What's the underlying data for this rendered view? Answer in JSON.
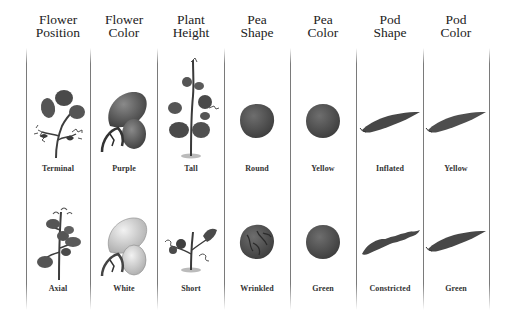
{
  "figure": {
    "columns": [
      {
        "id": "flower-position",
        "header": [
          "Flower",
          "Position"
        ],
        "dominant": "Terminal",
        "recessive": "Axial"
      },
      {
        "id": "flower-color",
        "header": [
          "Flower",
          "Color"
        ],
        "dominant": "Purple",
        "recessive": "White"
      },
      {
        "id": "plant-height",
        "header": [
          "Plant",
          "Height"
        ],
        "dominant": "Tall",
        "recessive": "Short"
      },
      {
        "id": "pea-shape",
        "header": [
          "Pea",
          "Shape"
        ],
        "dominant": "Round",
        "recessive": "Wrinkled"
      },
      {
        "id": "pea-color",
        "header": [
          "Pea",
          "Color"
        ],
        "dominant": "Yellow",
        "recessive": "Green"
      },
      {
        "id": "pod-shape",
        "header": [
          "Pod",
          "Shape"
        ],
        "dominant": "Inflated",
        "recessive": "Constricted"
      },
      {
        "id": "pod-color",
        "header": [
          "Pod",
          "Color"
        ],
        "dominant": "Yellow",
        "recessive": "Green"
      }
    ],
    "icons": {
      "flower-position-top": "terminal-flower-plant-icon",
      "flower-position-bottom": "axial-flower-plant-icon",
      "flower-color-top": "purple-flower-icon",
      "flower-color-bottom": "white-flower-icon",
      "plant-height-top": "tall-plant-icon",
      "plant-height-bottom": "short-plant-icon",
      "pea-shape-top": "round-pea-icon",
      "pea-shape-bottom": "wrinkled-pea-icon",
      "pea-color-top": "yellow-pea-icon",
      "pea-color-bottom": "green-pea-icon",
      "pod-shape-top": "inflated-pod-icon",
      "pod-shape-bottom": "constricted-pod-icon",
      "pod-color-top": "yellow-pod-icon",
      "pod-color-bottom": "green-pod-icon"
    },
    "colors": {
      "ink": "#222222",
      "divider": "#7a7a7a",
      "dark_fill": "#4a4a4a",
      "mid_fill": "#6b6b6b",
      "light_fill": "#d6d6d6"
    }
  }
}
